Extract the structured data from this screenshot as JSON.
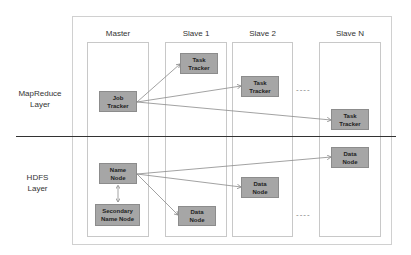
{
  "layers": {
    "mapreduce": {
      "line1": "MapReduce",
      "line2": "Layer"
    },
    "hdfs": {
      "line1": "HDFS",
      "line2": "Layer"
    }
  },
  "columns": [
    {
      "title": "Master"
    },
    {
      "title": "Slave 1"
    },
    {
      "title": "Slave 2"
    },
    {
      "title": "Slave N"
    }
  ],
  "nodes": {
    "job_tracker": {
      "line1": "Job",
      "line2": "Tracker"
    },
    "task_tracker_1": {
      "line1": "Task",
      "line2": "Tracker"
    },
    "task_tracker_2": {
      "line1": "Task",
      "line2": "Tracker"
    },
    "task_tracker_n": {
      "line1": "Task",
      "line2": "Tracker"
    },
    "name_node": {
      "line1": "Name",
      "line2": "Node"
    },
    "secondary_name_node": {
      "line1": "Secondary",
      "line2": "Name Node"
    },
    "data_node_1": {
      "line1": "Data",
      "line2": "Node"
    },
    "data_node_2": {
      "line1": "Data",
      "line2": "Node"
    },
    "data_node_n": {
      "line1": "Data",
      "line2": "Node"
    }
  },
  "ellipsis": "----",
  "colors": {
    "node_fill": "#a6a6a6",
    "node_border": "#8c8c8c",
    "line": "#8a8a8a",
    "divider": "#333333"
  }
}
